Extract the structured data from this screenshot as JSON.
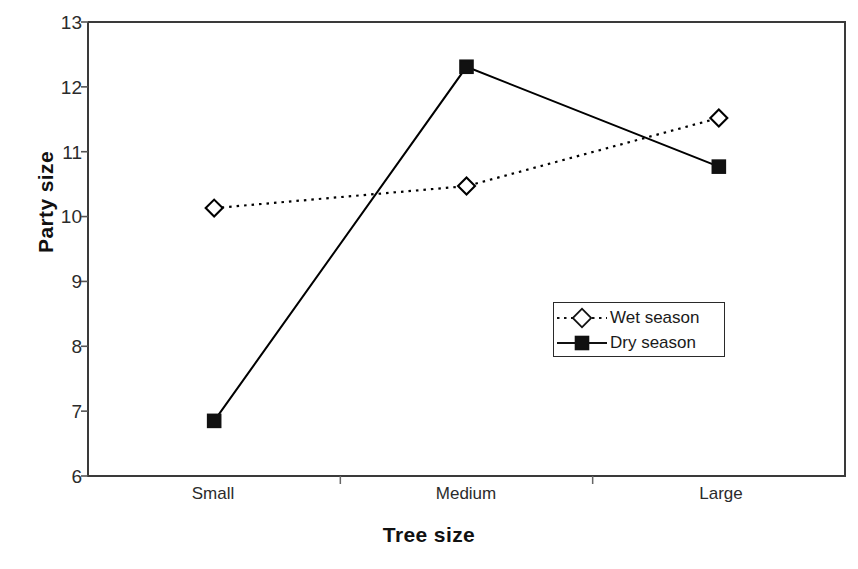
{
  "chart_data": {
    "type": "line",
    "title": "",
    "xlabel": "Tree size",
    "ylabel": "Party size",
    "categories": [
      "Small",
      "Medium",
      "Large"
    ],
    "series": [
      {
        "name": "Wet season",
        "values": [
          10.13,
          10.47,
          11.52
        ],
        "line_style": "dotted",
        "marker": "open-diamond",
        "color": "#000000"
      },
      {
        "name": "Dry season",
        "values": [
          6.85,
          12.31,
          10.77
        ],
        "line_style": "solid",
        "marker": "filled-square",
        "color": "#000000"
      }
    ],
    "ylim": [
      6,
      13
    ],
    "yticks": [
      6,
      7,
      8,
      9,
      10,
      11,
      12,
      13
    ],
    "ytick_labels": [
      "6",
      "7",
      "8",
      "9",
      "10",
      "11",
      "12",
      "13"
    ],
    "grid": false,
    "legend_position": "center-right",
    "legend_entries": [
      "Wet season",
      "Dry season"
    ],
    "axis_color": "#333333",
    "background": "#ffffff"
  }
}
